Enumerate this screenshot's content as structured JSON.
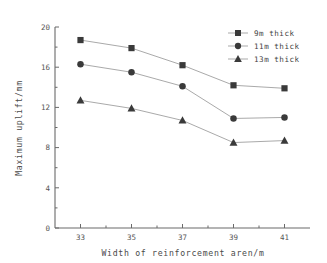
{
  "chart_data": {
    "type": "line",
    "title": "",
    "xlabel": "Width of reinforcement aren/m",
    "ylabel": "Maximum uplift/mm",
    "x": [
      33,
      35,
      37,
      39,
      41
    ],
    "xticklabels": [
      "33",
      "35",
      "37",
      "39",
      "41"
    ],
    "yticklabels": [
      "0",
      "4",
      "8",
      "12",
      "16",
      "20"
    ],
    "yticks": [
      0,
      4,
      8,
      12,
      16,
      20
    ],
    "xlim": [
      32,
      42
    ],
    "ylim": [
      0,
      20
    ],
    "grid": false,
    "legend_position": "top-right",
    "series": [
      {
        "name": "9m thick",
        "marker": "square",
        "values": [
          18.7,
          17.9,
          16.2,
          14.2,
          13.9
        ]
      },
      {
        "name": "11m thick",
        "marker": "circle",
        "values": [
          16.3,
          15.5,
          14.1,
          10.9,
          11.0
        ]
      },
      {
        "name": "13m thick",
        "marker": "triangle",
        "values": [
          12.7,
          11.9,
          10.7,
          8.5,
          8.7
        ]
      }
    ],
    "colors": {
      "marker": "#3a3a3a",
      "line": "#9a9a9a",
      "axis": "#6a6a6a",
      "text": "#4a4a4a",
      "background": "#ffffff"
    }
  }
}
